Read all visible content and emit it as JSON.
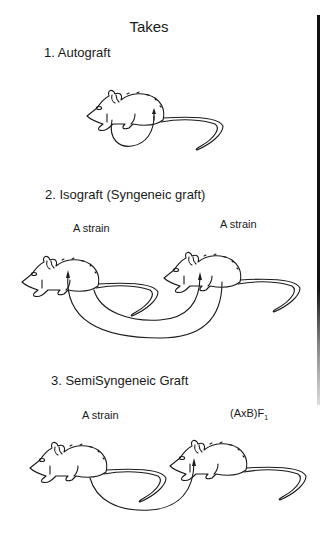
{
  "figure": {
    "title": "Takes",
    "sections": [
      {
        "number": "1.",
        "label": "1. Autograft",
        "strains": []
      },
      {
        "number": "2.",
        "label": "2. Isograft (Syngeneic graft)",
        "strains": [
          "A strain",
          "A strain"
        ]
      },
      {
        "number": "3.",
        "label": "3. SemiSyngeneic Graft",
        "strains": [
          "A strain",
          "(AxB)F",
          "1"
        ]
      }
    ],
    "icons": {
      "mouse": "mouse-drawing",
      "graft_arrow": "curved-arrow"
    },
    "colors": {
      "ink": "#1a1a1a",
      "background": "#ffffff",
      "edge_bar": "#111111"
    }
  }
}
